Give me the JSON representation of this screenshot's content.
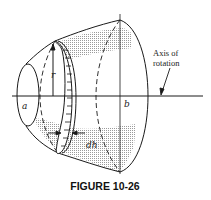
{
  "figure": {
    "caption": "FIGURE 10-26",
    "labels": {
      "a": "a",
      "b": "b",
      "r": "r",
      "dh": "dh",
      "axis_line1": "Axis of",
      "axis_line2": "rotation"
    },
    "colors": {
      "stroke": "#1a1a1a",
      "shading": "#c8c8c8",
      "background": "#ffffff"
    }
  }
}
